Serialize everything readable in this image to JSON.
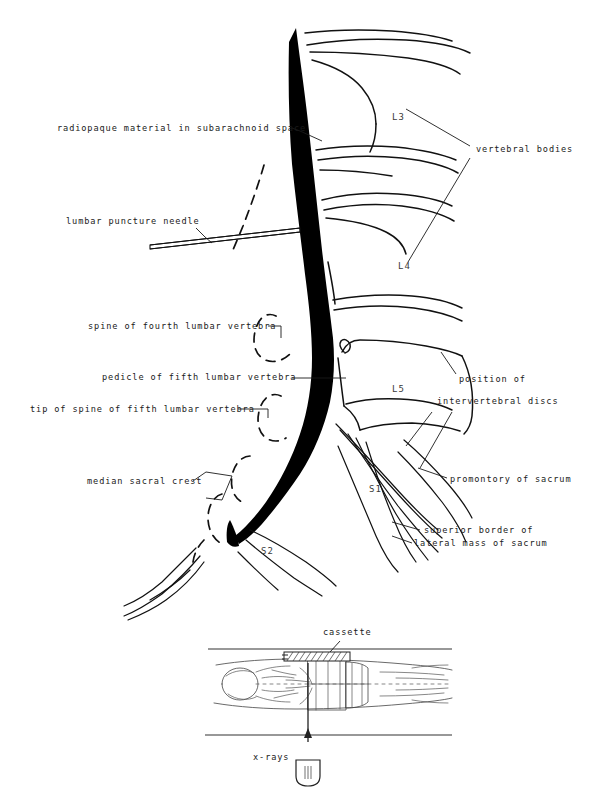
{
  "figure": {
    "background_color": "#ffffff",
    "ink_color": "#111111",
    "contrast_color": "#000000",
    "label_color": "#1a1a1a"
  },
  "labels_left": [
    {
      "id": "radiopaque-material",
      "text": "radiopaque material in subarachnoid space",
      "x": 57,
      "y": 131
    },
    {
      "id": "lumbar-puncture-needle",
      "text": "lumbar puncture needle",
      "x": 66,
      "y": 224
    },
    {
      "id": "spine-fourth-lumbar",
      "text": "spine of fourth lumbar vertebra",
      "x": 88,
      "y": 329
    },
    {
      "id": "pedicle-fifth-lumbar",
      "text": "pedicle of fifth lumbar vertebra",
      "x": 102,
      "y": 380
    },
    {
      "id": "tip-spine-fifth-lumbar",
      "text": "tip of spine of fifth lumbar vertebra",
      "x": 30,
      "y": 412
    },
    {
      "id": "median-sacral-crest",
      "text": "median sacral crest",
      "x": 87,
      "y": 484
    }
  ],
  "labels_right": [
    {
      "id": "vertebral-bodies",
      "text": "vertebral bodies",
      "x": 476,
      "y": 152
    },
    {
      "id": "position-intervertebral-discs-line1",
      "text": "position of",
      "x": 459,
      "y": 382
    },
    {
      "id": "position-intervertebral-discs-line2",
      "text": "intervertebral discs",
      "x": 437,
      "y": 404
    },
    {
      "id": "promontory-of-sacrum",
      "text": "promontory of sacrum",
      "x": 450,
      "y": 482
    },
    {
      "id": "superior-border-line1",
      "text": "superior border of",
      "x": 424,
      "y": 533
    },
    {
      "id": "superior-border-line2",
      "text": "lateral mass of sacrum",
      "x": 414,
      "y": 546
    }
  ],
  "vertebra_labels": [
    {
      "id": "vertebra-L3",
      "text": "L3",
      "x": 392,
      "y": 120
    },
    {
      "id": "vertebra-L4",
      "text": "L4",
      "x": 398,
      "y": 269
    },
    {
      "id": "vertebra-L5",
      "text": "L5",
      "x": 392,
      "y": 392
    },
    {
      "id": "vertebra-S1",
      "text": "S1",
      "x": 369,
      "y": 492
    },
    {
      "id": "vertebra-S2",
      "text": "S2",
      "x": 261,
      "y": 554
    }
  ],
  "inset": {
    "cassette_label": {
      "id": "cassette",
      "text": "cassette",
      "x": 323,
      "y": 635
    },
    "xrays_label": {
      "id": "x-rays",
      "text": "x-rays",
      "x": 253,
      "y": 760
    }
  }
}
